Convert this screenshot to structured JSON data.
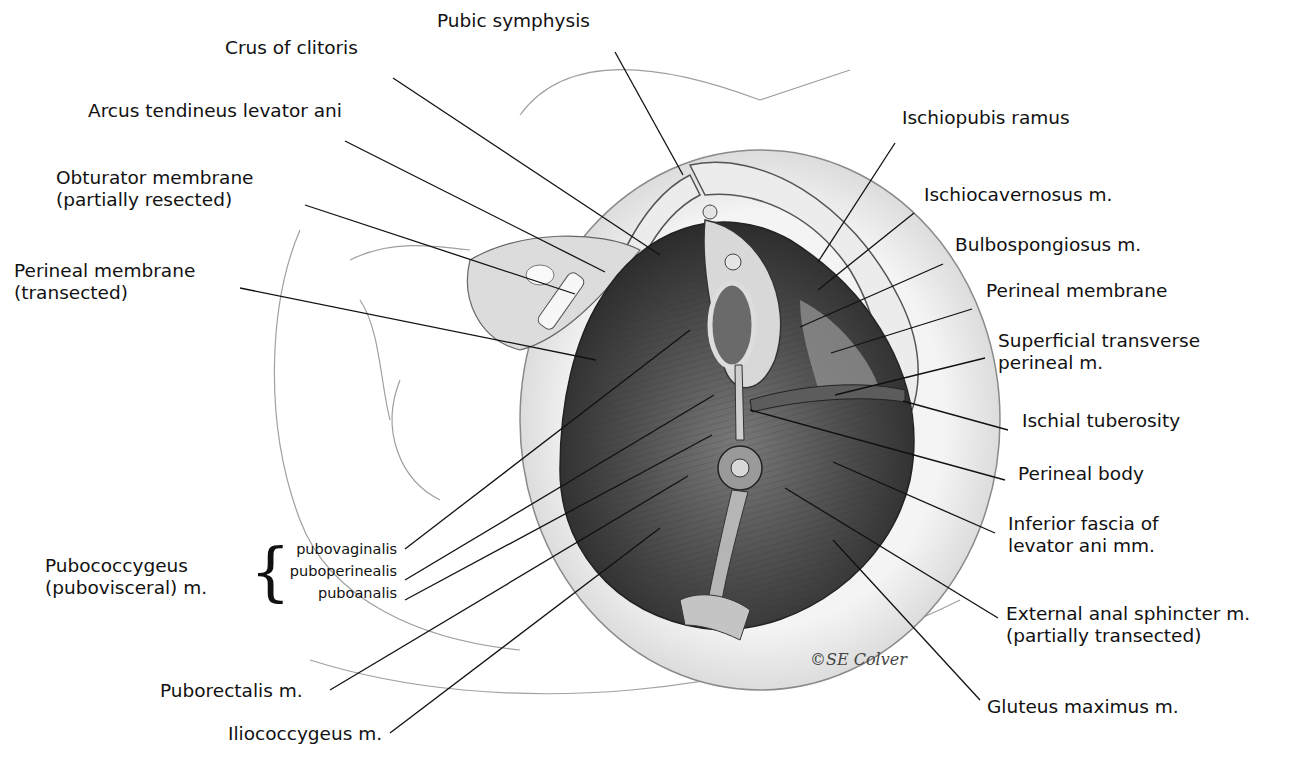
{
  "figure": {
    "signature": "©SE Colver",
    "colors": {
      "ink": "#111111",
      "muscle_dark": "#3a3a3a",
      "muscle_mid": "#6e6e6e",
      "bone": "#e9e9e9",
      "outline": "#9a9a9a"
    }
  },
  "labels": [
    {
      "id": "pubic-symphysis",
      "text": "Pubic symphysis",
      "x": 437,
      "y": 20,
      "line": [
        [
          615,
          52
        ],
        [
          683,
          175
        ]
      ]
    },
    {
      "id": "crus-of-clitoris",
      "text": "Crus of clitoris",
      "x": 225,
      "y": 47,
      "line": [
        [
          393,
          78
        ],
        [
          660,
          255
        ]
      ]
    },
    {
      "id": "arcus-tendineus",
      "text": "Arcus tendineus levator ani",
      "x": 88,
      "y": 110,
      "line": [
        [
          345,
          141
        ],
        [
          605,
          272
        ]
      ]
    },
    {
      "id": "obturator-membrane",
      "lines": [
        "Obturator membrane",
        "(partially resected)"
      ],
      "x": 56,
      "y": 177,
      "line": [
        [
          305,
          205
        ],
        [
          575,
          294
        ]
      ]
    },
    {
      "id": "perineal-membrane-transected",
      "lines": [
        "Perineal membrane",
        "(transected)"
      ],
      "x": 14,
      "y": 270,
      "line": [
        [
          240,
          288
        ],
        [
          596,
          360
        ]
      ]
    },
    {
      "id": "ischiopubis-ramus",
      "text": "Ischiopubis ramus",
      "x": 902,
      "y": 117,
      "line": [
        [
          895,
          143
        ],
        [
          818,
          262
        ]
      ]
    },
    {
      "id": "ischiocavernosus",
      "text": "Ischiocavernosus m.",
      "x": 924,
      "y": 194,
      "line": [
        [
          914,
          213
        ],
        [
          818,
          290
        ]
      ]
    },
    {
      "id": "bulbospongiosus",
      "text": "Bulbospongiosus m.",
      "x": 955,
      "y": 244,
      "line": [
        [
          943,
          264
        ],
        [
          800,
          327
        ]
      ]
    },
    {
      "id": "perineal-membrane",
      "text": "Perineal membrane",
      "x": 986,
      "y": 290,
      "line": [
        [
          972,
          309
        ],
        [
          831,
          353
        ]
      ]
    },
    {
      "id": "superficial-transverse",
      "lines": [
        "Superficial transverse",
        "perineal m."
      ],
      "x": 998,
      "y": 340,
      "line": [
        [
          985,
          358
        ],
        [
          835,
          395
        ]
      ]
    },
    {
      "id": "ischial-tuberosity",
      "text": "Ischial tuberosity",
      "x": 1022,
      "y": 420,
      "line": [
        [
          1008,
          430
        ],
        [
          903,
          401
        ]
      ]
    },
    {
      "id": "perineal-body",
      "text": "Perineal body",
      "x": 1018,
      "y": 473,
      "line": [
        [
          1005,
          480
        ],
        [
          750,
          410
        ]
      ]
    },
    {
      "id": "inferior-fascia",
      "lines": [
        "Inferior fascia of",
        "levator ani mm."
      ],
      "x": 1008,
      "y": 523,
      "line": [
        [
          995,
          533
        ],
        [
          833,
          462
        ]
      ]
    },
    {
      "id": "external-anal-sphincter",
      "lines": [
        "External anal sphincter m.",
        "(partially transected)"
      ],
      "x": 1006,
      "y": 613,
      "line": [
        [
          998,
          618
        ],
        [
          785,
          488
        ]
      ]
    },
    {
      "id": "gluteus-maximus",
      "text": "Gluteus maximus m.",
      "x": 987,
      "y": 706,
      "line": [
        [
          980,
          700
        ],
        [
          833,
          540
        ]
      ]
    },
    {
      "id": "puborectalis",
      "text": "Puborectalis m.",
      "x": 160,
      "y": 690,
      "line": [
        [
          330,
          690
        ],
        [
          688,
          476
        ]
      ]
    },
    {
      "id": "iliococcygeus",
      "text": "Iliococcygeus m.",
      "x": 228,
      "y": 733,
      "line": [
        [
          390,
          733
        ],
        [
          660,
          528
        ]
      ]
    }
  ],
  "group": {
    "id": "pubococcygeus",
    "title_lines": [
      "Pubococcygeus",
      "(pubovisceral) m."
    ],
    "x": 45,
    "y": 555,
    "brace": "{",
    "subparts": [
      {
        "id": "pubovaginalis",
        "text": "pubovaginalis",
        "x": 397,
        "y": 553,
        "line": [
          [
            405,
            549
          ],
          [
            690,
            330
          ]
        ]
      },
      {
        "id": "puboperinealis",
        "text": "puboperinealis",
        "x": 397,
        "y": 574,
        "line": [
          [
            405,
            580
          ],
          [
            714,
            395
          ]
        ]
      },
      {
        "id": "puboanalis",
        "text": "puboanalis",
        "x": 397,
        "y": 595,
        "line": [
          [
            405,
            600
          ],
          [
            712,
            435
          ]
        ]
      }
    ]
  }
}
